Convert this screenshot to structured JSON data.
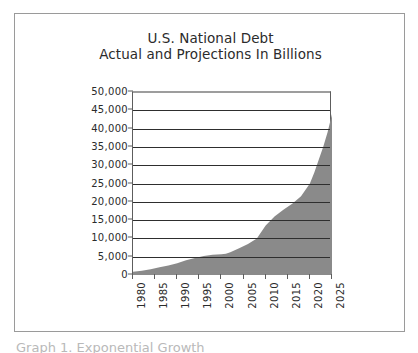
{
  "page": {
    "background_color": "#ffffff",
    "frame_border_color": "#9a9a9a",
    "cut_caption": "Graph 1. Exponential Growth"
  },
  "chart_data": {
    "type": "area",
    "title": "U.S. National Debt",
    "subtitle": "Actual and Projections In Billions",
    "xlabel": "",
    "ylabel": "",
    "series_name": "U.S. National Debt",
    "fill_color": "#8a8a8a",
    "gridline_color": "#2e2e2e",
    "axis_color": "#5d5d5d",
    "grid": true,
    "legend": false,
    "legend_position": "none",
    "xlim": [
      1980,
      2025
    ],
    "ylim": [
      0,
      50000
    ],
    "ytick_step": 5000,
    "xtick_step": 5,
    "xtick_labels": [
      "1980",
      "1985",
      "1990",
      "1995",
      "2000",
      "2005",
      "2010",
      "2015",
      "2020",
      "2025"
    ],
    "ytick_labels": [
      "50,000",
      "45,000",
      "40,000",
      "35,000",
      "30,000",
      "25,000",
      "20,000",
      "15,000",
      "10,000",
      "5,000",
      "0"
    ],
    "x": [
      1980,
      1982,
      1984,
      1986,
      1988,
      1990,
      1992,
      1994,
      1995,
      1996,
      1998,
      2000,
      2001,
      2002,
      2004,
      2006,
      2008,
      2010,
      2012,
      2014,
      2016,
      2018,
      2020,
      2021,
      2022,
      2023,
      2024,
      2025
    ],
    "values": [
      900,
      1150,
      1600,
      2100,
      2600,
      3200,
      4000,
      4650,
      4950,
      5200,
      5500,
      5650,
      5800,
      6200,
      7300,
      8500,
      10000,
      13500,
      16000,
      17800,
      19500,
      21500,
      25000,
      28000,
      31500,
      35000,
      39000,
      44000
    ]
  },
  "annotations": {
    "title_line_1": "U.S. National Debt",
    "title_line_2": "Actual and Projections In Billions"
  }
}
